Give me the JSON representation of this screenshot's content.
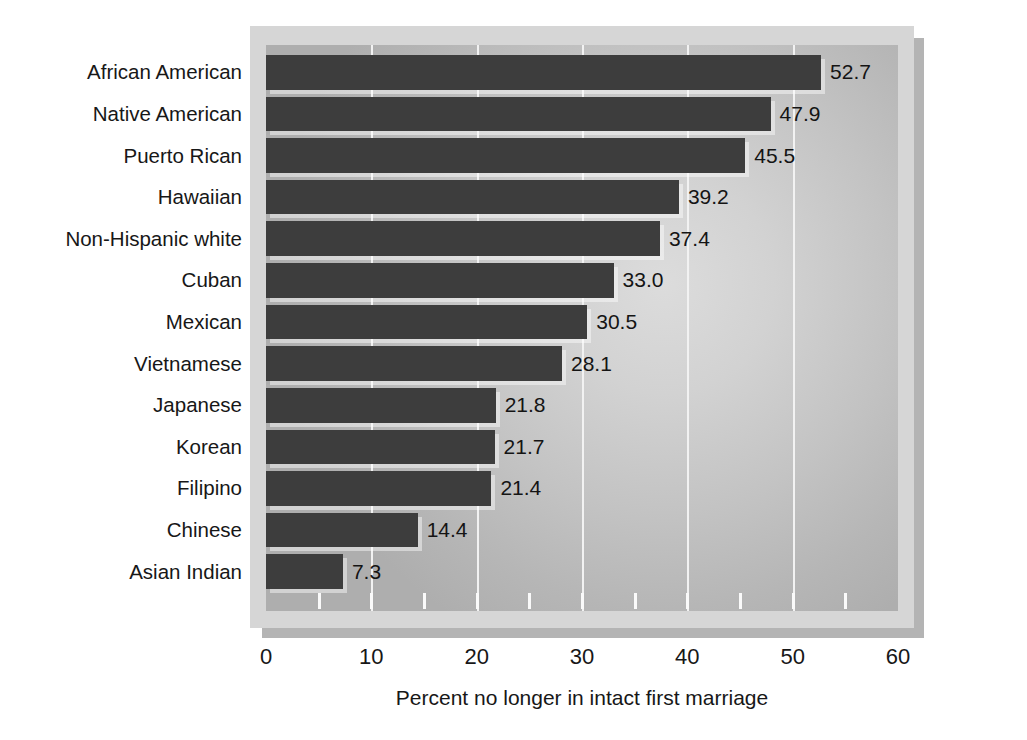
{
  "chart_data": {
    "type": "bar",
    "orientation": "horizontal",
    "title": "",
    "subtitle": "",
    "xlabel": "Percent no longer in intact first marriage",
    "ylabel": "",
    "xlim": [
      0,
      60
    ],
    "xticks": [
      0,
      10,
      20,
      30,
      40,
      50,
      60
    ],
    "xtick_labels": [
      "0",
      "10",
      "20",
      "30",
      "40",
      "50",
      "60"
    ],
    "minor_tick_interval": 5,
    "grid": "vertical major gridlines, white",
    "legend": "none",
    "bar_color": "#3d3d3d",
    "plot_background": "#c8c8c8",
    "categories": [
      "African American",
      "Native American",
      "Puerto Rican",
      "Hawaiian",
      "Non-Hispanic white",
      "Cuban",
      "Mexican",
      "Vietnamese",
      "Japanese",
      "Korean",
      "Filipino",
      "Chinese",
      "Asian Indian"
    ],
    "values": [
      52.7,
      47.9,
      45.5,
      39.2,
      37.4,
      33.0,
      30.5,
      28.1,
      21.8,
      21.7,
      21.4,
      14.4,
      7.3
    ],
    "value_labels": [
      "52.7",
      "47.9",
      "45.5",
      "39.2",
      "37.4",
      "33.0",
      "30.5",
      "28.1",
      "21.8",
      "21.7",
      "21.4",
      "14.4",
      "7.3"
    ]
  }
}
